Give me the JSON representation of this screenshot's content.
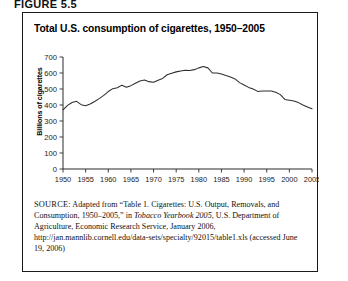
{
  "figure": {
    "label": "FIGURE 5.5",
    "title": "Total U.S. consumption of cigarettes, 1950–2005"
  },
  "source": {
    "label": "SOURCE:",
    "text_before_italic": " Adapted from “Table 1. Cigarettes: U.S. Output, Removals, and Consumption, 1950–2005,” in ",
    "italic_title": "Tobacco Yearbook 2005",
    "text_after_italic": ", U.S. Department of Agriculture, Economic Research Service, January 2006, http://jan.mannlib.cornell.edu/data-sets/specialty/92015/table1.xls (accessed June 19, 2006)"
  },
  "chart_data": {
    "type": "line",
    "title": "Total U.S. consumption of cigarettes, 1950–2005",
    "xlabel": "",
    "ylabel": "Billions of cigarettes",
    "xlim": [
      1950,
      2005
    ],
    "ylim": [
      0,
      700
    ],
    "grid": false,
    "legend": "none",
    "y_ticks": [
      0,
      100,
      200,
      300,
      400,
      500,
      600,
      700
    ],
    "x_ticks": [
      1950,
      1955,
      1960,
      1965,
      1970,
      1975,
      1980,
      1985,
      1990,
      1995,
      2000,
      2005
    ],
    "x": [
      1950,
      1951,
      1952,
      1953,
      1954,
      1955,
      1956,
      1957,
      1958,
      1959,
      1960,
      1961,
      1962,
      1963,
      1964,
      1965,
      1966,
      1967,
      1968,
      1969,
      1970,
      1971,
      1972,
      1973,
      1974,
      1975,
      1976,
      1977,
      1978,
      1979,
      1980,
      1981,
      1982,
      1983,
      1984,
      1985,
      1986,
      1987,
      1988,
      1989,
      1990,
      1991,
      1992,
      1993,
      1994,
      1995,
      1996,
      1997,
      1998,
      1999,
      2000,
      2001,
      2002,
      2003,
      2004,
      2005
    ],
    "values": [
      370,
      398,
      416,
      423,
      402,
      396,
      406,
      422,
      440,
      460,
      484,
      502,
      508,
      524,
      511,
      521,
      536,
      550,
      556,
      546,
      542,
      555,
      566,
      589,
      599,
      607,
      613,
      617,
      616,
      621,
      632,
      640,
      632,
      600,
      600,
      594,
      584,
      575,
      563,
      540,
      525,
      510,
      500,
      485,
      487,
      487,
      487,
      480,
      465,
      435,
      430,
      425,
      415,
      400,
      388,
      376
    ],
    "annotations": []
  }
}
